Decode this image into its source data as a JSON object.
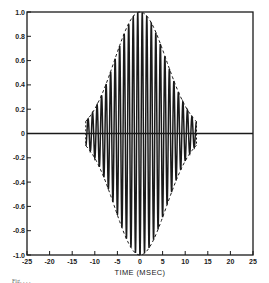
{
  "chart_data": {
    "type": "line",
    "title": "",
    "xlabel": "TIME (MSEC)",
    "ylabel": "",
    "xlim": [
      -25,
      25
    ],
    "ylim": [
      -1.0,
      1.0
    ],
    "grid": false,
    "legend": null,
    "x_ticks": [
      -25,
      -20,
      -15,
      -10,
      -5,
      0,
      5,
      10,
      15,
      20,
      25
    ],
    "x_tick_labels": [
      "-25",
      "-20",
      "-15",
      "-10",
      "-5",
      "0",
      "5",
      "10",
      "15",
      "20",
      "25"
    ],
    "y_ticks": [
      1.0,
      0.8,
      0.6,
      0.4,
      0.2,
      0,
      -0.2,
      -0.4,
      -0.6,
      -0.8,
      -1.0
    ],
    "y_tick_labels": [
      "1.0",
      "0.8",
      "0.6",
      "0.4",
      "0.2",
      "0",
      "-0.2",
      "-0.4",
      "-0.6",
      "-0.8",
      "-1.0"
    ],
    "series": [
      {
        "name": "waveform",
        "style": "solid",
        "description": "Oscillating tone burst, ~1 kHz carrier, amplitude-modulated by envelope; starts near t=-12 ms, ends near t=+12.5 ms",
        "x": [
          -12,
          -11.5,
          -11,
          -10.5,
          -10,
          -9.5,
          -9,
          -8.5,
          -8,
          -7.5,
          -7,
          -6.5,
          -6,
          -5.5,
          -5,
          -4.5,
          -4,
          -3.5,
          -3,
          -2.5,
          -2,
          -1.5,
          -1,
          -0.5,
          0,
          0.5,
          1,
          1.5,
          2,
          2.5,
          3,
          3.5,
          4,
          4.5,
          5,
          5.5,
          6,
          6.5,
          7,
          7.5,
          8,
          8.5,
          9,
          9.5,
          10,
          10.5,
          11,
          11.5,
          12,
          12.5
        ],
        "y": [
          0.0,
          0.08,
          -0.08,
          0.12,
          -0.14,
          0.17,
          -0.2,
          0.25,
          -0.28,
          0.33,
          -0.37,
          0.43,
          -0.47,
          0.53,
          -0.58,
          0.63,
          -0.68,
          0.72,
          -0.77,
          0.82,
          -0.86,
          0.9,
          -0.93,
          0.97,
          -1.0,
          0.97,
          -0.95,
          0.92,
          -0.88,
          0.84,
          -0.8,
          0.75,
          -0.7,
          0.65,
          -0.6,
          0.55,
          -0.5,
          0.45,
          -0.4,
          0.35,
          -0.31,
          0.26,
          -0.22,
          0.18,
          -0.15,
          0.12,
          -0.1,
          0.08,
          -0.06,
          0.0
        ]
      },
      {
        "name": "envelope_upper",
        "style": "dashed",
        "x": [
          -12,
          -10,
          -8,
          -6,
          -4,
          -2,
          0,
          2,
          4,
          6,
          8,
          10,
          12.5
        ],
        "y": [
          0.08,
          0.14,
          0.28,
          0.47,
          0.68,
          0.86,
          1.0,
          0.88,
          0.7,
          0.5,
          0.31,
          0.15,
          0.06
        ]
      },
      {
        "name": "envelope_lower",
        "style": "dashed",
        "x": [
          -12,
          -10,
          -8,
          -6,
          -4,
          -2,
          0,
          2,
          4,
          6,
          8,
          10,
          12.5
        ],
        "y": [
          -0.08,
          -0.14,
          -0.28,
          -0.47,
          -0.68,
          -0.86,
          -1.0,
          -0.88,
          -0.7,
          -0.5,
          -0.31,
          -0.15,
          -0.06
        ]
      }
    ],
    "annotations": [
      "zero reference line at y=0"
    ]
  },
  "figure": {
    "xlabel": "TIME (MSEC)",
    "caption_partial": "Fig. . . ."
  },
  "colors": {
    "ink": "#1a1a1a",
    "background": "#ffffff"
  }
}
